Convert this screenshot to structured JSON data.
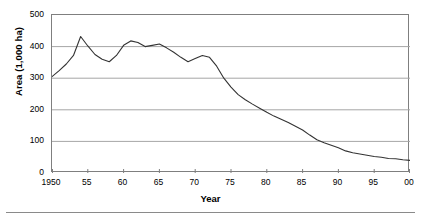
{
  "chart_data": {
    "type": "line",
    "title": "",
    "xlabel": "Year",
    "ylabel": "Area (1,000 ha)",
    "xlim": [
      1950,
      2000
    ],
    "ylim": [
      0,
      500
    ],
    "grid": true,
    "legend": "none",
    "y_ticks": [
      500,
      400,
      300,
      200,
      100,
      0
    ],
    "y_tick_labels": [
      "500",
      "400",
      "300",
      "200",
      "100",
      "0"
    ],
    "x_ticks": [
      1950,
      1955,
      1960,
      1965,
      1970,
      1975,
      1980,
      1985,
      1990,
      1995,
      2000
    ],
    "x_tick_labels": [
      "1950",
      "55",
      "60",
      "65",
      "70",
      "75",
      "80",
      "85",
      "90",
      "95",
      "00"
    ],
    "line_color": "#333333",
    "grid_color": "#a6a6a6",
    "axis_color": "#7f7f7f",
    "background_color": "#ffffff",
    "x": [
      1950,
      1951,
      1952,
      1953,
      1954,
      1955,
      1956,
      1957,
      1958,
      1959,
      1960,
      1961,
      1962,
      1963,
      1964,
      1965,
      1966,
      1967,
      1968,
      1969,
      1970,
      1971,
      1972,
      1973,
      1974,
      1975,
      1976,
      1977,
      1978,
      1979,
      1980,
      1981,
      1982,
      1983,
      1984,
      1985,
      1986,
      1987,
      1988,
      1989,
      1990,
      1991,
      1992,
      1993,
      1994,
      1995,
      1996,
      1997,
      1998,
      1999,
      2000
    ],
    "values": [
      305,
      324,
      345,
      372,
      432,
      402,
      375,
      360,
      352,
      372,
      404,
      418,
      413,
      400,
      404,
      408,
      396,
      382,
      366,
      352,
      362,
      372,
      366,
      338,
      300,
      272,
      248,
      232,
      218,
      205,
      192,
      180,
      170,
      160,
      148,
      136,
      120,
      105,
      96,
      88,
      80,
      70,
      64,
      60,
      56,
      52,
      50,
      46,
      45,
      42,
      40
    ],
    "series": [
      {
        "name": "Area",
        "values": [
          305,
          324,
          345,
          372,
          432,
          402,
          375,
          360,
          352,
          372,
          404,
          418,
          413,
          400,
          404,
          408,
          396,
          382,
          366,
          352,
          362,
          372,
          366,
          338,
          300,
          272,
          248,
          232,
          218,
          205,
          192,
          180,
          170,
          160,
          148,
          136,
          120,
          105,
          96,
          88,
          80,
          70,
          64,
          60,
          56,
          52,
          50,
          46,
          45,
          42,
          40
        ]
      }
    ],
    "annotations": []
  },
  "axes": {
    "y_title": "Area (1,000 ha)",
    "x_title": "Year"
  }
}
